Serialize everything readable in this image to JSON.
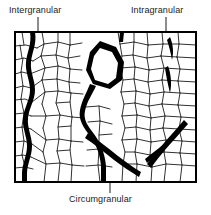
{
  "figure": {
    "type": "micrograph-schematic",
    "frame": {
      "x": 15,
      "y": 32,
      "width": 181,
      "height": 150
    },
    "colors": {
      "background": "#ffffff",
      "grain_boundary": "#1a1a1a",
      "crack": "#000000",
      "frame": "#000000",
      "text": "#1a1a1a",
      "leader": "#1a1a1a"
    }
  },
  "labels": {
    "intergranular": "Intergranular",
    "intragranular": "Intragranular",
    "circumgranular": "Circumgranular"
  },
  "leaders": {
    "intergranular": {
      "from_x": 38,
      "from_y": 17,
      "to_x": 38,
      "to_y": 40
    },
    "intragranular": {
      "from_x": 166,
      "from_y": 17,
      "to_x": 166,
      "to_y": 62
    },
    "circumgranular": {
      "from_x": 110,
      "from_y": 193,
      "to_x": 110,
      "to_y": 170
    }
  },
  "cracks": [
    {
      "name": "intergranular-crack",
      "description": "thick wavy vertical crack along grain boundaries on left side, spans full height"
    },
    {
      "name": "circumgranular-crack",
      "description": "thick crack encircling a central hexagonal grain then branching downward"
    },
    {
      "name": "intragranular-crack-upper",
      "description": "lens shaped crack inside a grain, upper right"
    },
    {
      "name": "intragranular-crack-lower",
      "description": "lens shaped crack inside a grain, mid right"
    },
    {
      "name": "lower-right-crack",
      "description": "thick diagonal crack lower right"
    }
  ]
}
